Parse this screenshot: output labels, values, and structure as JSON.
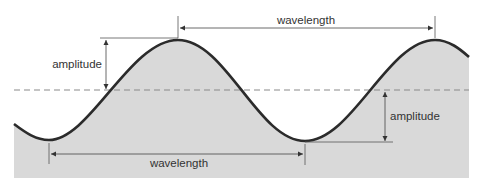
{
  "diagram": {
    "labels": {
      "wavelength_top": "wavelength",
      "wavelength_bottom": "wavelength",
      "amplitude_left": "amplitude",
      "amplitude_right": "amplitude"
    },
    "elements": {
      "wave": "sinusoidal wave curve with two crests and two troughs",
      "fill": "gray fill beneath the wave",
      "midline": "dashed horizontal rest line"
    },
    "colors": {
      "fill": "#d9d9d9",
      "wave_stroke": "#2b2b2b",
      "midline": "#8a8a8a",
      "annotation": "#444444",
      "text": "#333333"
    }
  }
}
